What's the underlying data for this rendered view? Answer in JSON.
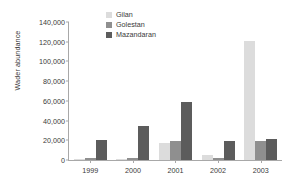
{
  "chart_data": {
    "type": "bar",
    "title": "",
    "subtitle": "",
    "xlabel": "",
    "ylabel": "Wader abundance",
    "categories": [
      "1999",
      "2000",
      "2001",
      "2002",
      "2003"
    ],
    "series": [
      {
        "name": "Gilan",
        "color": "#dcdcdc",
        "values": [
          600,
          1400,
          17000,
          5000,
          120500
        ]
      },
      {
        "name": "Golestan",
        "color": "#8f8f8f",
        "values": [
          1700,
          2400,
          19300,
          2500,
          19000
        ]
      },
      {
        "name": "Mazandaran",
        "color": "#5c5c5c",
        "values": [
          20500,
          34500,
          58500,
          19300,
          21000
        ]
      }
    ],
    "ylim": [
      0,
      140000
    ],
    "ytick_step": 20000,
    "ytick_labels": [
      "0",
      "20,000",
      "40,000",
      "60,000",
      "80,000",
      "100,000",
      "120,000",
      "140,000"
    ],
    "ytick_values": [
      0,
      20000,
      40000,
      60000,
      80000,
      100000,
      120000,
      140000
    ],
    "grid": false,
    "legend_position": "top-left-inside",
    "orientation": "vertical",
    "grouping": "grouped"
  },
  "axes": {
    "y_title": "Wader abundance"
  }
}
